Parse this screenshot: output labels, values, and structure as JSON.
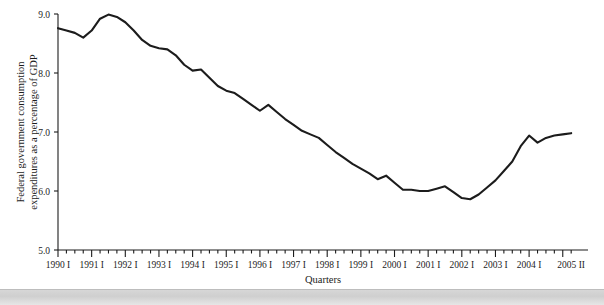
{
  "figure": {
    "background_color": "#ffffff",
    "line_color": "#1c1c1c",
    "axis_color": "#1c1c1c"
  },
  "chart_data": {
    "type": "line",
    "title": "",
    "subtitle": "",
    "xlabel": "Quarters",
    "ylabel": "Federal government consumption expenditures as a percentage of GDP",
    "ylim": [
      5.0,
      9.0
    ],
    "ytick_labels": [
      "5.0",
      "6.0",
      "7.0",
      "8.0",
      "9.0"
    ],
    "ytick_values": [
      5.0,
      6.0,
      7.0,
      8.0,
      9.0
    ],
    "grid": false,
    "legend": "none",
    "xtick_labels": [
      "1990 I",
      "1991 I",
      "1992 I",
      "1993 I",
      "1994 I",
      "1995 I",
      "1996 I",
      "1997 I",
      "1998 I",
      "1999 I",
      "2000 I",
      "2001 I",
      "2002 I",
      "2003 I",
      "2004 I",
      "2005 II"
    ],
    "x_first_period": "1990 I",
    "x_last_period": "2005 II",
    "x_minor_ticks_per_year": 4,
    "x": [
      "1990 I",
      "1990 II",
      "1990 III",
      "1990 IV",
      "1991 I",
      "1991 II",
      "1991 III",
      "1991 IV",
      "1992 I",
      "1992 II",
      "1992 III",
      "1992 IV",
      "1993 I",
      "1993 II",
      "1993 III",
      "1993 IV",
      "1994 I",
      "1994 II",
      "1994 III",
      "1994 IV",
      "1995 I",
      "1995 II",
      "1995 III",
      "1995 IV",
      "1996 I",
      "1996 II",
      "1996 III",
      "1996 IV",
      "1997 I",
      "1997 II",
      "1997 III",
      "1997 IV",
      "1998 I",
      "1998 II",
      "1998 III",
      "1998 IV",
      "1999 I",
      "1999 II",
      "1999 III",
      "1999 IV",
      "2000 I",
      "2000 II",
      "2000 III",
      "2000 IV",
      "2001 I",
      "2001 II",
      "2001 III",
      "2001 IV",
      "2002 I",
      "2002 II",
      "2002 III",
      "2002 IV",
      "2003 I",
      "2003 II",
      "2003 III",
      "2003 IV",
      "2004 I",
      "2004 II",
      "2004 III",
      "2004 IV",
      "2005 I",
      "2005 II"
    ],
    "values": [
      8.76,
      8.72,
      8.68,
      8.6,
      8.72,
      8.92,
      8.99,
      8.95,
      8.86,
      8.72,
      8.56,
      8.46,
      8.42,
      8.4,
      8.3,
      8.14,
      8.04,
      8.06,
      7.92,
      7.78,
      7.7,
      7.66,
      7.56,
      7.46,
      7.36,
      7.46,
      7.34,
      7.22,
      7.12,
      7.02,
      6.96,
      6.9,
      6.78,
      6.66,
      6.56,
      6.46,
      6.38,
      6.3,
      6.2,
      6.26,
      6.14,
      6.02,
      6.02,
      6.0,
      6.0,
      6.04,
      6.08,
      5.98,
      5.88,
      5.86,
      5.94,
      6.06,
      6.18,
      6.34,
      6.5,
      6.76,
      6.94,
      6.82,
      6.9,
      6.94,
      6.96,
      6.98
    ],
    "series": [
      {
        "name": "Federal government consumption expenditures as a percentage of GDP",
        "values": [
          8.76,
          8.72,
          8.68,
          8.6,
          8.72,
          8.92,
          8.99,
          8.95,
          8.86,
          8.72,
          8.56,
          8.46,
          8.42,
          8.4,
          8.3,
          8.14,
          8.04,
          8.06,
          7.92,
          7.78,
          7.7,
          7.66,
          7.56,
          7.46,
          7.36,
          7.46,
          7.34,
          7.22,
          7.12,
          7.02,
          6.96,
          6.9,
          6.78,
          6.66,
          6.56,
          6.46,
          6.38,
          6.3,
          6.2,
          6.26,
          6.14,
          6.02,
          6.02,
          6.0,
          6.0,
          6.04,
          6.08,
          5.98,
          5.88,
          5.86,
          5.94,
          6.06,
          6.18,
          6.34,
          6.5,
          6.76,
          6.94,
          6.82,
          6.9,
          6.94,
          6.96,
          6.98
        ]
      }
    ],
    "annotations": []
  }
}
